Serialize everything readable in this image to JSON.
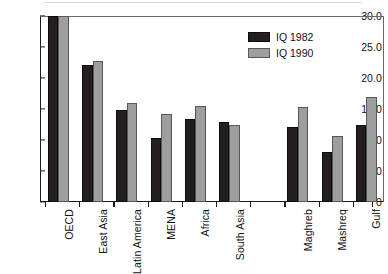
{
  "chart_data": {
    "type": "bar",
    "title": "",
    "subtitle": "",
    "xlabel": "",
    "ylabel": "",
    "categories": [
      "OECD",
      "East Asia",
      "Latin America",
      "MENA",
      "Africa",
      "South Asia",
      "",
      "Maghreb",
      "Mashreq",
      "Gulf"
    ],
    "series": [
      {
        "name": "IQ 1982",
        "color": "#231f1f",
        "values": [
          30.0,
          22.1,
          14.9,
          10.3,
          13.4,
          12.9,
          null,
          12.1,
          8.1,
          12.4
        ]
      },
      {
        "name": "IQ 1990",
        "color": "#9e9e9e",
        "values": [
          30.0,
          22.7,
          16.0,
          14.2,
          15.5,
          12.4,
          null,
          15.4,
          10.6,
          16.9
        ]
      }
    ],
    "ylim": [
      0,
      30
    ],
    "ytick_values": [
      30.0,
      25.0,
      20.0,
      15.0,
      10.0,
      5.0,
      0
    ],
    "ytick_labels": [
      "30.0",
      "25.0",
      "20.0",
      "15.0",
      "10.0",
      "5.0",
      "0"
    ],
    "grid": false,
    "legend_position": "top-right"
  },
  "legend": {
    "entries": [
      {
        "label": "IQ 1982",
        "swatch": "s0"
      },
      {
        "label": "IQ 1990",
        "swatch": "s1"
      }
    ]
  }
}
